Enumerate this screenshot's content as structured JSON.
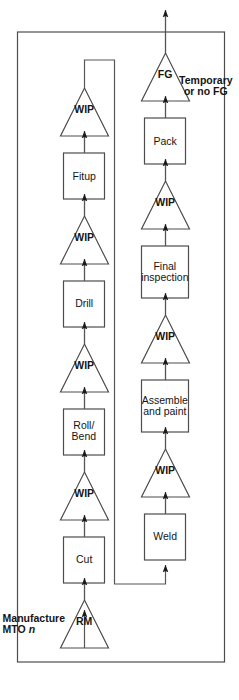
{
  "diagram": {
    "type": "process-flow",
    "title": "Manufacture\nMTO n",
    "title_plain": "Manufacture MTO n",
    "title_italic_suffix": "n",
    "boundary_note": "Temporary\nor no FG",
    "boundary_note_plain": "Temporary or no FG",
    "colors": {
      "stroke": "#4d4d4d",
      "arrow": "#1a1a1a",
      "text": "#141414",
      "background": "#ffffff",
      "node_fill": "#ffffff"
    },
    "rows": [
      {
        "name": "row-1",
        "nodes": [
          {
            "id": "rm",
            "shape": "triangle",
            "label": "RM"
          },
          {
            "id": "cut",
            "shape": "box",
            "label": "Cut"
          },
          {
            "id": "wip-1",
            "shape": "triangle",
            "label": "WIP"
          },
          {
            "id": "roll-bend",
            "shape": "box",
            "label": "Roll/\nBend"
          },
          {
            "id": "wip-2",
            "shape": "triangle",
            "label": "WIP"
          },
          {
            "id": "drill",
            "shape": "box",
            "label": "Drill"
          },
          {
            "id": "wip-3",
            "shape": "triangle",
            "label": "WIP"
          },
          {
            "id": "fitup",
            "shape": "box",
            "label": "Fitup"
          },
          {
            "id": "wip-4",
            "shape": "triangle",
            "label": "WIP"
          }
        ]
      },
      {
        "name": "row-2",
        "nodes": [
          {
            "id": "weld",
            "shape": "box",
            "label": "Weld"
          },
          {
            "id": "wip-5",
            "shape": "triangle",
            "label": "WIP"
          },
          {
            "id": "assemble-and-paint",
            "shape": "box",
            "label": "Assemble\nand paint"
          },
          {
            "id": "wip-6",
            "shape": "triangle",
            "label": "WIP"
          },
          {
            "id": "final-inspection",
            "shape": "box",
            "label": "Final\ninspection"
          },
          {
            "id": "wip-7",
            "shape": "triangle",
            "label": "WIP"
          },
          {
            "id": "pack",
            "shape": "box",
            "label": "Pack"
          },
          {
            "id": "fg",
            "shape": "triangle",
            "label": "FG"
          }
        ]
      }
    ],
    "connectors": {
      "input_arrow": "raw material in",
      "output_arrow": "finished goods out",
      "wrap_arrow": "row-1 to row-2 wrap"
    }
  }
}
